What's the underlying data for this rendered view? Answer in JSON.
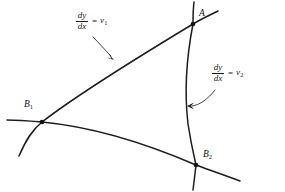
{
  "figure": {
    "background_color": "#ffffff",
    "stroke_color": "#1d1d1d",
    "text_color": "#1a1a1a",
    "width": 285,
    "height": 192
  },
  "annotations": {
    "slope_label_1": {
      "numerator": "dy",
      "denominator": "dx",
      "equals": "=",
      "value": "v",
      "subscript": "1",
      "full_text": "dy/dx = v1"
    },
    "slope_label_2": {
      "numerator": "dy",
      "denominator": "dx",
      "equals": "=",
      "value": "v",
      "subscript": "2",
      "full_text": "dy/dx = v2"
    }
  },
  "points": [
    {
      "id": "A",
      "base": "A",
      "subscript": "",
      "x": 193,
      "y": 24
    },
    {
      "id": "B1",
      "base": "B",
      "subscript": "1",
      "x": 42,
      "y": 122
    },
    {
      "id": "B2",
      "base": "B",
      "subscript": "2",
      "x": 196,
      "y": 165
    }
  ],
  "curves": [
    {
      "id": "curve-upper",
      "describes": "slope_label_1",
      "path": "M 19 156 C 26 140 32 130 42 122 C 78 94 140 56 193 24 C 201 19 210 15 218 11"
    },
    {
      "id": "curve-right",
      "describes": "slope_label_2",
      "path": "M 194 2 C 193 10 193 17 193 24 C 186 60 184 90 188 124 C 191 144 194 156 196 165 C 195 174 194 182 193 190"
    },
    {
      "id": "curve-lower",
      "describes": "",
      "path": "M 7 120 C 18 120 30 121 42 122 C 95 127 152 146 196 165 C 212 171 227 176 240 181"
    }
  ],
  "leaders": [
    {
      "id": "leader-1",
      "from_label": "slope_label_1",
      "path": "M 93 37 C 100 44 105 50 111 56",
      "arrow_at": {
        "x": 114,
        "y": 59
      }
    },
    {
      "id": "leader-2",
      "from_label": "slope_label_2",
      "path": "M 215 90 C 208 99 200 105 192 106",
      "arrow_at": {
        "x": 188,
        "y": 106
      }
    }
  ]
}
